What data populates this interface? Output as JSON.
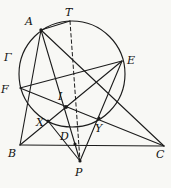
{
  "figure": {
    "canvas": {
      "width": 171,
      "height": 188,
      "background": "#f8f8f5",
      "line_color": "#1c1c1c",
      "label_color": "#101010"
    },
    "circle": {
      "id": "Gamma",
      "label": "Γ",
      "cx": 72,
      "cy": 74,
      "r": 53,
      "label_x": 4,
      "label_y": 61
    },
    "points": [
      {
        "id": "T",
        "label": "T",
        "x": 70,
        "y": 21,
        "label_x": 65,
        "label_y": 16,
        "dot": false
      },
      {
        "id": "A",
        "label": "A",
        "x": 41,
        "y": 30,
        "label_x": 25,
        "label_y": 25,
        "dot": true,
        "dot_r": 1.7
      },
      {
        "id": "E",
        "label": "E",
        "x": 122,
        "y": 61,
        "label_x": 127,
        "label_y": 64,
        "dot": false
      },
      {
        "id": "F",
        "label": "F",
        "x": 20,
        "y": 88,
        "label_x": 1,
        "label_y": 93,
        "dot": false
      },
      {
        "id": "I",
        "label": "I",
        "x": 66,
        "y": 107,
        "label_x": 58,
        "label_y": 100,
        "dot": true,
        "dot_r": 1.9
      },
      {
        "id": "X",
        "label": "X",
        "x": 48,
        "y": 121,
        "label_x": 36,
        "label_y": 126,
        "dot": true,
        "dot_r": 1.5
      },
      {
        "id": "Y",
        "label": "Y",
        "x": 99,
        "y": 118,
        "label_x": 95,
        "label_y": 132,
        "dot": true,
        "dot_r": 1.5
      },
      {
        "id": "D",
        "label": "D",
        "x": 75,
        "y": 144,
        "label_x": 60,
        "label_y": 140,
        "dot": true,
        "dot_r": 1.6
      },
      {
        "id": "B",
        "label": "B",
        "x": 20,
        "y": 145,
        "label_x": 8,
        "label_y": 157,
        "dot": false
      },
      {
        "id": "C",
        "label": "C",
        "x": 164,
        "y": 146,
        "label_x": 156,
        "label_y": 158,
        "dot": false
      },
      {
        "id": "P",
        "label": "P",
        "x": 80,
        "y": 161,
        "label_x": 75,
        "label_y": 176,
        "dot": true,
        "dot_r": 1.6
      }
    ],
    "segments": [
      {
        "from": "B",
        "to": "C",
        "style": "solid"
      },
      {
        "from": "A",
        "to": "B",
        "style": "solid"
      },
      {
        "from": "A",
        "to": "C",
        "style": "solid"
      },
      {
        "from": "A",
        "to": "P",
        "style": "solid"
      },
      {
        "from": "B",
        "to": "E",
        "style": "solid"
      },
      {
        "from": "C",
        "to": "F",
        "style": "solid"
      },
      {
        "from": "E",
        "to": "F",
        "style": "solid"
      },
      {
        "from": "E",
        "to": "P",
        "style": "solid"
      },
      {
        "from": "X",
        "to": "P",
        "style": "solid"
      },
      {
        "from": "A",
        "to": "T",
        "style": "solid"
      },
      {
        "from": "T",
        "to": "P",
        "style": "dashed"
      }
    ]
  }
}
